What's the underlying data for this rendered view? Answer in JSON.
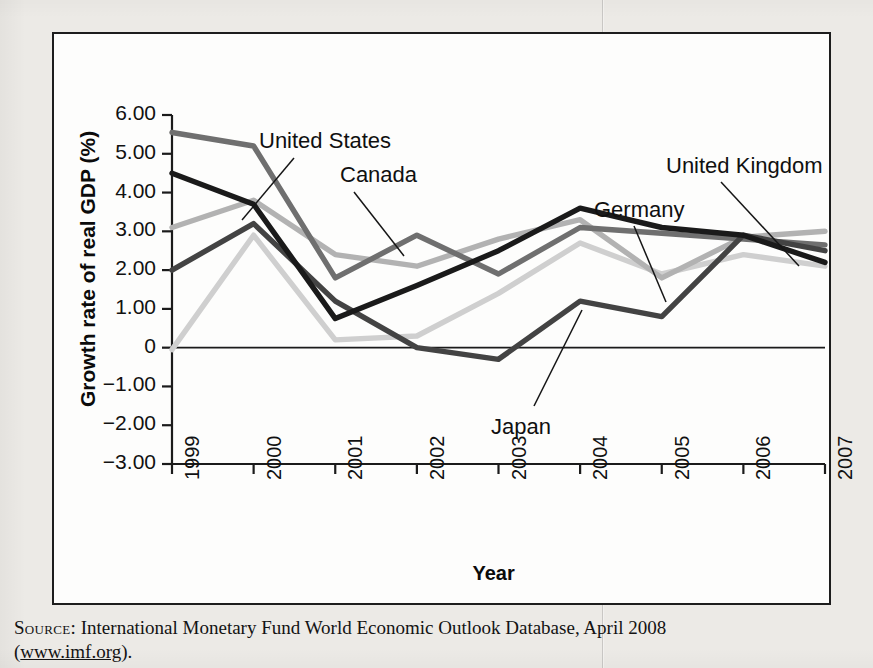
{
  "figure": {
    "source_prefix": "Source:",
    "source_text": " International Monetary Fund World Economic Outlook Database, April 2008 (",
    "source_url": "www.imf.org",
    "source_suffix": ")."
  },
  "chart_data": {
    "type": "line",
    "title": "",
    "xlabel": "Year",
    "ylabel": "Growth rate of real GDP (%)",
    "categories": [
      "1999",
      "2000",
      "2001",
      "2002",
      "2003",
      "2004",
      "2005",
      "2006",
      "2007"
    ],
    "x": [
      1999,
      2000,
      2001,
      2002,
      2003,
      2004,
      2005,
      2006,
      2007
    ],
    "xlim": [
      1999,
      2007
    ],
    "ylim": [
      -3.0,
      6.0
    ],
    "ytick_labels": [
      "6.00",
      "5.00",
      "4.00",
      "3.00",
      "2.00",
      "1.00",
      "0",
      "-1.00",
      "-2.00",
      "-3.00"
    ],
    "ytick_values": [
      6,
      5,
      4,
      3,
      2,
      1,
      0,
      -1,
      -2,
      -3
    ],
    "grid": false,
    "legend": "inline-annotations",
    "zero_line": true,
    "series": [
      {
        "name": "Canada",
        "color": "#6f6f6f",
        "values": [
          5.55,
          5.2,
          1.8,
          2.9,
          1.9,
          3.1,
          2.95,
          2.8,
          2.65
        ],
        "label_x": 286,
        "label_y": 128,
        "leader_from": [
          300,
          158
        ],
        "leader_to": [
          350,
          222
        ]
      },
      {
        "name": "United States",
        "color": "#1a1a1a",
        "values": [
          4.5,
          3.7,
          0.75,
          1.6,
          2.5,
          3.6,
          3.1,
          2.9,
          2.2
        ],
        "label_x": 205,
        "label_y": 94,
        "leader_from": [
          240,
          124
        ],
        "leader_to": [
          188,
          186
        ]
      },
      {
        "name": "United Kingdom",
        "color": "#b2b2b2",
        "values": [
          3.1,
          3.8,
          2.4,
          2.1,
          2.8,
          3.3,
          1.8,
          2.85,
          3.0
        ],
        "label_x": 612,
        "label_y": 119,
        "leader_from": [
          667,
          148
        ],
        "leader_to": [
          745,
          232
        ]
      },
      {
        "name": "Germany",
        "color": "#434343",
        "values": [
          2.0,
          3.2,
          1.2,
          0.0,
          -0.3,
          1.2,
          0.8,
          2.9,
          2.5
        ],
        "label_x": 540,
        "label_y": 163,
        "leader_from": [
          580,
          192
        ],
        "leader_to": [
          612,
          268
        ]
      },
      {
        "name": "Japan",
        "color": "#cfcfcf",
        "values": [
          -0.05,
          2.9,
          0.2,
          0.3,
          1.4,
          2.7,
          1.9,
          2.4,
          2.1
        ],
        "label_x": 437,
        "label_y": 380,
        "leader_from": [
          480,
          372
        ],
        "leader_to": [
          528,
          276
        ]
      }
    ]
  }
}
